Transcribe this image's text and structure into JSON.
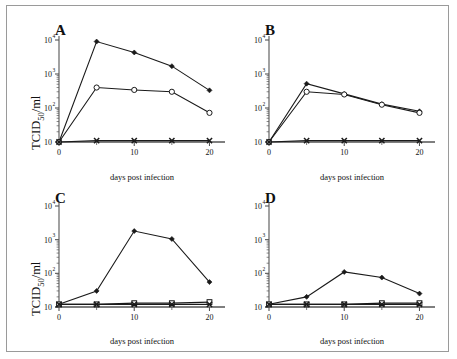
{
  "figure": {
    "panels": [
      {
        "letter": "A",
        "xlabel": "days post infection",
        "ylabel_main": "TCID",
        "ylabel_sub": "50",
        "ylabel_tail": "/ml",
        "show_ylabel": true
      },
      {
        "letter": "B",
        "xlabel": "days post infection",
        "ylabel_main": "TCID",
        "ylabel_sub": "50",
        "ylabel_tail": "/ml",
        "show_ylabel": false
      },
      {
        "letter": "C",
        "xlabel": "days post infection",
        "ylabel_main": "TCID",
        "ylabel_sub": "50",
        "ylabel_tail": "/ml",
        "show_ylabel": true
      },
      {
        "letter": "D",
        "xlabel": "days post infection",
        "ylabel_main": "TCID",
        "ylabel_sub": "50",
        "ylabel_tail": "/ml",
        "show_ylabel": false
      }
    ],
    "ytick_labels": [
      "10",
      "10",
      "10",
      "10"
    ],
    "ytick_exponents": [
      "4",
      "3",
      "2",
      ""
    ],
    "xtick_labels": [
      "0",
      "10",
      "20"
    ],
    "colors": {
      "line": "#1a1a1a",
      "axis": "#555555",
      "frame": "#9a9a9a",
      "marker_fill": "#1a1a1a",
      "marker_open": "#ffffff"
    }
  },
  "chart_data": [
    {
      "type": "line",
      "panel": "A",
      "title": "A",
      "xlabel": "days post infection",
      "ylabel": "TCID50/ml",
      "x": [
        0,
        5,
        10,
        15,
        20
      ],
      "xlim": [
        0,
        21
      ],
      "ylim": [
        10,
        10000
      ],
      "yscale": "log",
      "xticks": [
        0,
        10,
        20
      ],
      "xminorticks": [
        5,
        15
      ],
      "yticks": [
        10,
        100,
        1000,
        10000
      ],
      "grid": false,
      "legend": "none",
      "series": [
        {
          "name": "filled-diamond",
          "marker": "diamond-filled",
          "values": [
            10,
            9000,
            4300,
            1700,
            330
          ]
        },
        {
          "name": "open-circle",
          "marker": "circle-open",
          "values": [
            10,
            400,
            340,
            300,
            72
          ]
        },
        {
          "name": "cross",
          "marker": "x-filled",
          "values": [
            10,
            11,
            11,
            11,
            11
          ]
        }
      ]
    },
    {
      "type": "line",
      "panel": "B",
      "title": "B",
      "xlabel": "days post infection",
      "ylabel": "TCID50/ml",
      "x": [
        0,
        5,
        10,
        15,
        20
      ],
      "xlim": [
        0,
        21
      ],
      "ylim": [
        10,
        10000
      ],
      "yscale": "log",
      "xticks": [
        0,
        10,
        20
      ],
      "xminorticks": [
        5,
        15
      ],
      "yticks": [
        10,
        100,
        1000,
        10000
      ],
      "grid": false,
      "legend": "none",
      "series": [
        {
          "name": "filled-diamond",
          "marker": "diamond-filled",
          "values": [
            10,
            520,
            260,
            130,
            80
          ]
        },
        {
          "name": "open-circle",
          "marker": "circle-open",
          "values": [
            10,
            300,
            250,
            125,
            72
          ]
        },
        {
          "name": "cross",
          "marker": "x-filled",
          "values": [
            10,
            11,
            11,
            11,
            11
          ]
        }
      ]
    },
    {
      "type": "line",
      "panel": "C",
      "title": "C",
      "xlabel": "days post infection",
      "ylabel": "TCID50/ml",
      "x": [
        0,
        5,
        10,
        15,
        20
      ],
      "xlim": [
        0,
        21
      ],
      "ylim": [
        10,
        10000
      ],
      "yscale": "log",
      "xticks": [
        0,
        10,
        20
      ],
      "xminorticks": [
        5,
        15
      ],
      "yticks": [
        10,
        100,
        1000,
        10000
      ],
      "grid": false,
      "legend": "none",
      "series": [
        {
          "name": "filled-diamond",
          "marker": "diamond-filled",
          "values": [
            12,
            30,
            1800,
            1050,
            55
          ]
        },
        {
          "name": "open-square",
          "marker": "square-open",
          "values": [
            12,
            12,
            13,
            13,
            14
          ]
        },
        {
          "name": "cross",
          "marker": "x-filled",
          "values": [
            12,
            12,
            12,
            12,
            12
          ]
        }
      ]
    },
    {
      "type": "line",
      "panel": "D",
      "title": "D",
      "xlabel": "days post infection",
      "ylabel": "TCID50/ml",
      "x": [
        0,
        5,
        10,
        15,
        20
      ],
      "xlim": [
        0,
        21
      ],
      "ylim": [
        10,
        10000
      ],
      "yscale": "log",
      "xticks": [
        0,
        10,
        20
      ],
      "xminorticks": [
        5,
        15
      ],
      "yticks": [
        10,
        100,
        1000,
        10000
      ],
      "grid": false,
      "legend": "none",
      "series": [
        {
          "name": "filled-diamond",
          "marker": "diamond-filled",
          "values": [
            12,
            20,
            110,
            75,
            25
          ]
        },
        {
          "name": "open-square",
          "marker": "square-open",
          "values": [
            12,
            12,
            12,
            13,
            13
          ]
        },
        {
          "name": "cross",
          "marker": "x-filled",
          "values": [
            12,
            12,
            12,
            12,
            12
          ]
        }
      ]
    }
  ]
}
